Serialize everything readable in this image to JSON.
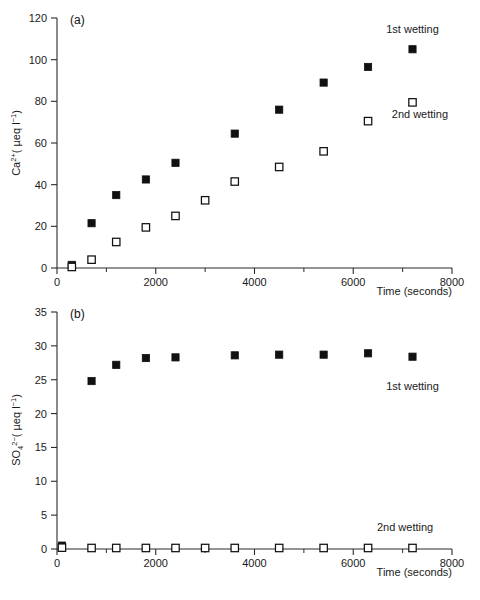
{
  "figure": {
    "background": "#ffffff",
    "marker_color": "#111111",
    "axis_color": "#2b2b2b",
    "caption": ""
  },
  "chart_data": [
    {
      "type": "scatter",
      "panel": "(a)",
      "title": "",
      "xlabel": "Time (seconds)",
      "ylabel": "Ca2+( µeq l-1)",
      "ylabel_parts": {
        "base": "Ca",
        "sup": "2+",
        "rest": "( µeq l",
        "rest_sup": "−1",
        "tail": ")"
      },
      "xlim": [
        0,
        8000
      ],
      "ylim": [
        0,
        120
      ],
      "xticks": [
        0,
        2000,
        4000,
        6000,
        8000
      ],
      "xtick_labels": [
        "0",
        "2000",
        "4000",
        "6000",
        "8000"
      ],
      "xminor_step": 1000,
      "yticks": [
        0,
        20,
        40,
        60,
        80,
        100,
        120
      ],
      "ytick_labels": [
        "0",
        "20",
        "40",
        "60",
        "80",
        "100",
        "120"
      ],
      "grid": false,
      "legend_position": "inside-right",
      "series": [
        {
          "name": "1st wetting",
          "marker": "filled-square",
          "x": [
            300,
            700,
            1200,
            1800,
            2400,
            3600,
            4500,
            5400,
            6300,
            7200
          ],
          "y": [
            1.5,
            21.5,
            35.0,
            42.5,
            50.5,
            64.5,
            76.0,
            89.0,
            96.5,
            105.0
          ]
        },
        {
          "name": "2nd wetting",
          "marker": "open-square",
          "x": [
            300,
            700,
            1200,
            1800,
            2400,
            3000,
            3600,
            4500,
            5400,
            6300,
            7200
          ],
          "y": [
            0.5,
            4.0,
            12.5,
            19.5,
            25.0,
            32.5,
            41.5,
            48.5,
            56.0,
            70.5,
            79.5
          ]
        }
      ],
      "annotations": [
        {
          "text": "1st wetting",
          "x": 7200,
          "y": 113
        },
        {
          "text": "2nd wetting",
          "x": 7350,
          "y": 72
        }
      ]
    },
    {
      "type": "scatter",
      "panel": "(b)",
      "title": "",
      "xlabel": "Time (seconds)",
      "ylabel": "SO42-( µeq l-1)",
      "ylabel_parts": {
        "base": "SO",
        "sub": "4",
        "sup": "2−",
        "rest": "( µeq l",
        "rest_sup": "−1",
        "tail": ")"
      },
      "xlim": [
        0,
        8000
      ],
      "ylim": [
        0,
        35
      ],
      "xticks": [
        0,
        2000,
        4000,
        6000,
        8000
      ],
      "xtick_labels": [
        "0",
        "2000",
        "4000",
        "6000",
        "8000"
      ],
      "xminor_step": 1000,
      "yticks": [
        0,
        5,
        10,
        15,
        20,
        25,
        30,
        35
      ],
      "ytick_labels": [
        "0",
        "5",
        "10",
        "15",
        "20",
        "25",
        "30",
        "35"
      ],
      "grid": false,
      "legend_position": "inside-right",
      "series": [
        {
          "name": "1st wetting",
          "marker": "filled-square",
          "x": [
            100,
            700,
            1200,
            1800,
            2400,
            3600,
            4500,
            5400,
            6300,
            7200
          ],
          "y": [
            0.5,
            24.8,
            27.2,
            28.2,
            28.3,
            28.6,
            28.7,
            28.7,
            28.9,
            28.4
          ]
        },
        {
          "name": "2nd wetting",
          "marker": "open-square",
          "x": [
            100,
            700,
            1200,
            1800,
            2400,
            3000,
            3600,
            4500,
            5400,
            6300,
            7200
          ],
          "y": [
            0.2,
            0.15,
            0.15,
            0.15,
            0.15,
            0.15,
            0.15,
            0.15,
            0.15,
            0.15,
            0.15
          ]
        }
      ],
      "annotations": [
        {
          "text": "1st wetting",
          "x": 7200,
          "y": 23.5
        },
        {
          "text": "2nd wetting",
          "x": 7050,
          "y": 2.6
        }
      ]
    }
  ]
}
